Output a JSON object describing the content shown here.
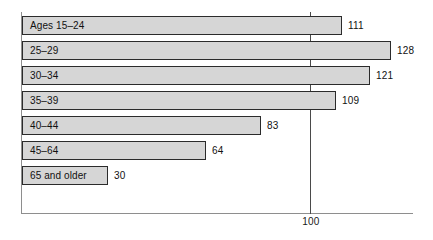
{
  "chart_data": {
    "type": "bar",
    "orientation": "horizontal",
    "title": "",
    "xlabel": "",
    "ylabel": "",
    "xlim": [
      0,
      143
    ],
    "grid": false,
    "legend": null,
    "reference_line": {
      "value": 100,
      "label": "100"
    },
    "categories": [
      "Ages 15–24",
      "25–29",
      "30–34",
      "35–39",
      "40–44",
      "45–64",
      "65 and older"
    ],
    "values": [
      111,
      128,
      121,
      109,
      83,
      64,
      30
    ],
    "value_labels": [
      "111",
      "128",
      "121",
      "109",
      "83",
      "64",
      "30"
    ],
    "bars": [
      {
        "label": "Ages 15–24",
        "value": 111,
        "value_label": "111"
      },
      {
        "label": "25–29",
        "value": 128,
        "value_label": "128"
      },
      {
        "label": "30–34",
        "value": 121,
        "value_label": "121"
      },
      {
        "label": "35–39",
        "value": 109,
        "value_label": "109"
      },
      {
        "label": "40–44",
        "value": 83,
        "value_label": "83"
      },
      {
        "label": "45–64",
        "value": 64,
        "value_label": "64"
      },
      {
        "label": "65 and older",
        "value": 30,
        "value_label": "30"
      }
    ],
    "colors": {
      "bar_fill": "#d6d6d6",
      "bar_border": "#2b2b2b",
      "axis": "#8e8e8e",
      "reference_line": "#4a4a4a",
      "text": "#111111",
      "background": "#ffffff"
    }
  }
}
